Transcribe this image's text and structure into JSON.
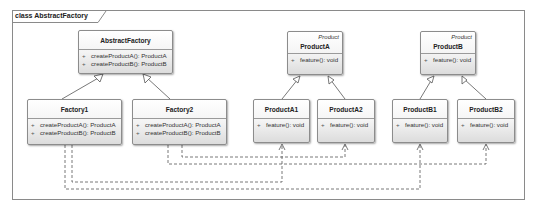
{
  "diagram": {
    "frame_label": "class AbstractFactory",
    "classes": {
      "abstract_factory": {
        "name": "AbstractFactory",
        "operations": [
          {
            "vis": "+",
            "sig": "createProductA(): ProductA"
          },
          {
            "vis": "+",
            "sig": "createProductB(): ProductB"
          }
        ]
      },
      "factory1": {
        "name": "Factory1",
        "operations": [
          {
            "vis": "+",
            "sig": "createProductA(): ProductA"
          },
          {
            "vis": "+",
            "sig": "createProductB(): ProductB"
          }
        ]
      },
      "factory2": {
        "name": "Factory2",
        "operations": [
          {
            "vis": "+",
            "sig": "createProductA(): ProductA"
          },
          {
            "vis": "+",
            "sig": "createProductB(): ProductB"
          }
        ]
      },
      "product_a": {
        "stereotype": "Product",
        "name": "ProductA",
        "operations": [
          {
            "vis": "+",
            "sig": "feature(): void"
          }
        ]
      },
      "product_b": {
        "stereotype": "Product",
        "name": "ProductB",
        "operations": [
          {
            "vis": "+",
            "sig": "feature(): void"
          }
        ]
      },
      "product_a1": {
        "name": "ProductA1",
        "operations": [
          {
            "vis": "+",
            "sig": "feature(): void"
          }
        ]
      },
      "product_a2": {
        "name": "ProductA2",
        "operations": [
          {
            "vis": "+",
            "sig": "feature(): void"
          }
        ]
      },
      "product_b1": {
        "name": "ProductB1",
        "operations": [
          {
            "vis": "+",
            "sig": "feature(): void"
          }
        ]
      },
      "product_b2": {
        "name": "ProductB2",
        "operations": [
          {
            "vis": "+",
            "sig": "feature(): void"
          }
        ]
      }
    },
    "relationships": [
      {
        "type": "generalization",
        "from": "Factory1",
        "to": "AbstractFactory"
      },
      {
        "type": "generalization",
        "from": "Factory2",
        "to": "AbstractFactory"
      },
      {
        "type": "generalization",
        "from": "ProductA1",
        "to": "ProductA"
      },
      {
        "type": "generalization",
        "from": "ProductA2",
        "to": "ProductA"
      },
      {
        "type": "generalization",
        "from": "ProductB1",
        "to": "ProductB"
      },
      {
        "type": "generalization",
        "from": "ProductB2",
        "to": "ProductB"
      },
      {
        "type": "dependency",
        "from": "Factory1",
        "to": "ProductA1"
      },
      {
        "type": "dependency",
        "from": "Factory1",
        "to": "ProductB1"
      },
      {
        "type": "dependency",
        "from": "Factory2",
        "to": "ProductA2"
      },
      {
        "type": "dependency",
        "from": "Factory2",
        "to": "ProductB2"
      }
    ]
  }
}
